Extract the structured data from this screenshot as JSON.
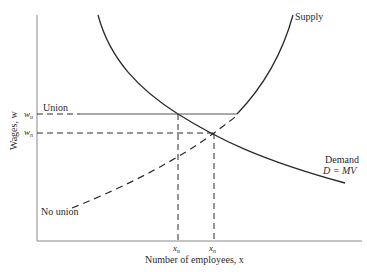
{
  "diagram": {
    "axes": {
      "x_label": "Number of employees, x",
      "y_label": "Wages, w"
    },
    "curves": {
      "supply": {
        "label": "Supply"
      },
      "demand": {
        "label": "Demand",
        "sublabel": "D = MV"
      },
      "union": {
        "label": "Union"
      },
      "no_union": {
        "label": "No union"
      }
    },
    "ticks": {
      "w_u": {
        "symbol": "w",
        "sub": "u"
      },
      "w_n": {
        "symbol": "w",
        "sub": "n"
      },
      "x_u": {
        "symbol": "x",
        "sub": "u"
      },
      "x_n": {
        "symbol": "x",
        "sub": "n"
      }
    },
    "colors": {
      "line": "#2a2a2a",
      "axis": "#8a8a8a",
      "background": "#ffffff"
    }
  }
}
